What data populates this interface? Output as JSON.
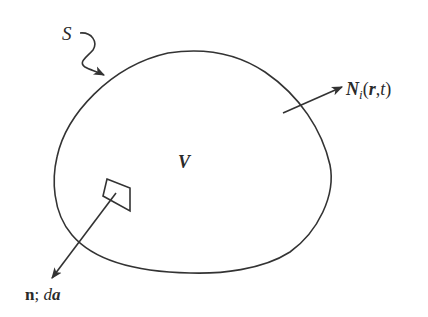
{
  "diagram": {
    "type": "control-volume",
    "labels": {
      "surface": "S",
      "volume": "V",
      "flux_symbol": "N",
      "flux_subscript": "i",
      "flux_open": "(",
      "flux_arg1": "r",
      "flux_sep": ",",
      "flux_arg2": "t",
      "flux_close": ")",
      "normal": "n",
      "normal_sep": "; ",
      "area_d": "d",
      "area_a": "a"
    },
    "colors": {
      "stroke": "#333333",
      "background": "#ffffff"
    }
  }
}
